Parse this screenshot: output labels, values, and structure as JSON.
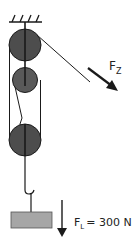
{
  "diagram": {
    "type": "pulley-system",
    "colors": {
      "line": "#1a1a1a",
      "pulley_fill": "#4d4d4d",
      "weight_fill": "#a6a6a6",
      "background": "#ffffff"
    },
    "labels": {
      "pull_force": {
        "symbol": "F",
        "subscript": "Z"
      },
      "load_force": {
        "symbol": "F",
        "subscript": "L",
        "equals": "= 300 N"
      }
    },
    "components": [
      "ceiling-mount",
      "fixed-pulley-top",
      "movable-pulley-middle",
      "movable-pulley-bottom",
      "hook",
      "load-weight"
    ]
  }
}
